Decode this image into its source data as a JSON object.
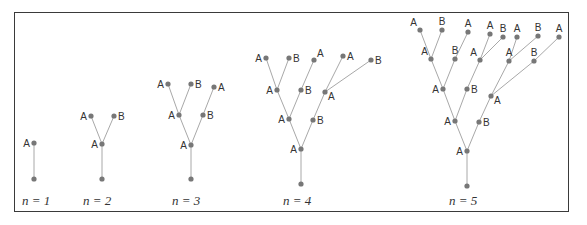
{
  "figure": {
    "edge_color": "#a8a8a8",
    "node_color": "#777777",
    "frame_color": "#3a3a3a",
    "panels": [
      {
        "label": "n = 1",
        "label_pos": [
          22,
          205
        ],
        "nodes": [
          {
            "id": "r",
            "x": 34,
            "y": 179,
            "label": ""
          },
          {
            "id": "a",
            "x": 34,
            "y": 143,
            "label": "A",
            "side": "left"
          }
        ],
        "edges": [
          [
            "r",
            "a"
          ]
        ]
      },
      {
        "label": "n = 2",
        "label_pos": [
          83,
          205
        ],
        "nodes": [
          {
            "id": "r",
            "x": 102,
            "y": 179,
            "label": ""
          },
          {
            "id": "a",
            "x": 102,
            "y": 144,
            "label": "A",
            "side": "left"
          },
          {
            "id": "aa",
            "x": 91,
            "y": 116,
            "label": "A",
            "side": "left"
          },
          {
            "id": "ab",
            "x": 114,
            "y": 116,
            "label": "B",
            "side": "right"
          }
        ],
        "edges": [
          [
            "r",
            "a"
          ],
          [
            "a",
            "aa"
          ],
          [
            "a",
            "ab"
          ]
        ]
      },
      {
        "label": "n = 3",
        "label_pos": [
          172,
          205
        ],
        "nodes": [
          {
            "id": "r",
            "x": 191,
            "y": 179,
            "label": ""
          },
          {
            "id": "a",
            "x": 191,
            "y": 145,
            "label": "A",
            "side": "left"
          },
          {
            "id": "aa",
            "x": 179,
            "y": 115,
            "label": "A",
            "side": "left"
          },
          {
            "id": "ab",
            "x": 203,
            "y": 115,
            "label": "B",
            "side": "right"
          },
          {
            "id": "aaa",
            "x": 168,
            "y": 84,
            "label": "A",
            "side": "left"
          },
          {
            "id": "aab",
            "x": 191,
            "y": 84,
            "label": "B",
            "side": "right"
          },
          {
            "id": "aba",
            "x": 214,
            "y": 87,
            "label": "A",
            "side": "right"
          }
        ],
        "edges": [
          [
            "r",
            "a"
          ],
          [
            "a",
            "aa"
          ],
          [
            "a",
            "ab"
          ],
          [
            "aa",
            "aaa"
          ],
          [
            "aa",
            "aab"
          ],
          [
            "ab",
            "aba"
          ]
        ]
      },
      {
        "label": "n = 4",
        "label_pos": [
          283,
          205
        ],
        "nodes": [
          {
            "id": "r",
            "x": 301,
            "y": 184,
            "label": ""
          },
          {
            "id": "a",
            "x": 301,
            "y": 149,
            "label": "A",
            "side": "left"
          },
          {
            "id": "aa",
            "x": 289,
            "y": 119,
            "label": "A",
            "side": "left"
          },
          {
            "id": "ab",
            "x": 313,
            "y": 120,
            "label": "B",
            "side": "right"
          },
          {
            "id": "aaa",
            "x": 277,
            "y": 90,
            "label": "A",
            "side": "left"
          },
          {
            "id": "aab",
            "x": 301,
            "y": 90,
            "label": "B",
            "side": "right"
          },
          {
            "id": "aba",
            "x": 325,
            "y": 92,
            "label": "A",
            "side": "right-below"
          },
          {
            "id": "aaaa",
            "x": 266,
            "y": 58,
            "label": "A",
            "side": "left"
          },
          {
            "id": "aaab",
            "x": 289,
            "y": 58,
            "label": "B",
            "side": "right"
          },
          {
            "id": "aaba",
            "x": 314,
            "y": 60,
            "label": "A",
            "side": "right-above"
          },
          {
            "id": "abaa",
            "x": 343,
            "y": 56,
            "label": "A",
            "side": "right"
          },
          {
            "id": "abab",
            "x": 371,
            "y": 60,
            "label": "B",
            "side": "right"
          }
        ],
        "edges": [
          [
            "r",
            "a"
          ],
          [
            "a",
            "aa"
          ],
          [
            "a",
            "ab"
          ],
          [
            "aa",
            "aaa"
          ],
          [
            "aa",
            "aab"
          ],
          [
            "ab",
            "aba"
          ],
          [
            "aaa",
            "aaaa"
          ],
          [
            "aaa",
            "aaab"
          ],
          [
            "aab",
            "aaba"
          ],
          [
            "aba",
            "abaa"
          ],
          [
            "aba",
            "abab"
          ]
        ]
      },
      {
        "label": "n = 5",
        "label_pos": [
          449,
          205
        ],
        "nodes": [
          {
            "id": "r",
            "x": 467,
            "y": 186,
            "label": ""
          },
          {
            "id": "a",
            "x": 467,
            "y": 151,
            "label": "A",
            "side": "left"
          },
          {
            "id": "aa",
            "x": 455,
            "y": 121,
            "label": "A",
            "side": "left"
          },
          {
            "id": "ab",
            "x": 479,
            "y": 122,
            "label": "B",
            "side": "right"
          },
          {
            "id": "aaa",
            "x": 443,
            "y": 89,
            "label": "A",
            "side": "left"
          },
          {
            "id": "aab",
            "x": 467,
            "y": 89,
            "label": "B",
            "side": "right"
          },
          {
            "id": "aba",
            "x": 491,
            "y": 96,
            "label": "A",
            "side": "right-below"
          },
          {
            "id": "aaaa",
            "x": 431,
            "y": 59,
            "label": "A",
            "side": "left-above"
          },
          {
            "id": "aaab",
            "x": 455,
            "y": 59,
            "label": "B",
            "side": "above"
          },
          {
            "id": "aaba",
            "x": 480,
            "y": 60,
            "label": "A",
            "side": "left-above"
          },
          {
            "id": "abaa",
            "x": 509,
            "y": 61,
            "label": "A",
            "side": "above"
          },
          {
            "id": "abab",
            "x": 534,
            "y": 61,
            "label": "B",
            "side": "above"
          },
          {
            "id": "aaaaa",
            "x": 420,
            "y": 30,
            "label": "A",
            "side": "left-above"
          },
          {
            "id": "aaaab",
            "x": 442,
            "y": 30,
            "label": "B",
            "side": "above"
          },
          {
            "id": "aaaba",
            "x": 468,
            "y": 32,
            "label": "A",
            "side": "above"
          },
          {
            "id": "aabaa",
            "x": 490,
            "y": 34,
            "label": "A",
            "side": "above"
          },
          {
            "id": "aabab",
            "x": 503,
            "y": 37,
            "label": "B",
            "side": "above"
          },
          {
            "id": "abaaa",
            "x": 517,
            "y": 37,
            "label": "A",
            "side": "above"
          },
          {
            "id": "abaab",
            "x": 538,
            "y": 36,
            "label": "B",
            "side": "above"
          },
          {
            "id": "ababa",
            "x": 559,
            "y": 37,
            "label": "A",
            "side": "above"
          }
        ],
        "edges": [
          [
            "r",
            "a"
          ],
          [
            "a",
            "aa"
          ],
          [
            "a",
            "ab"
          ],
          [
            "aa",
            "aaa"
          ],
          [
            "aa",
            "aab"
          ],
          [
            "ab",
            "aba"
          ],
          [
            "aaa",
            "aaaa"
          ],
          [
            "aaa",
            "aaab"
          ],
          [
            "aab",
            "aaba"
          ],
          [
            "aba",
            "abaa"
          ],
          [
            "aba",
            "abab"
          ],
          [
            "aaaa",
            "aaaaa"
          ],
          [
            "aaaa",
            "aaaab"
          ],
          [
            "aaab",
            "aaaba"
          ],
          [
            "aaba",
            "aabaa"
          ],
          [
            "aaba",
            "aabab"
          ],
          [
            "abaa",
            "abaaa"
          ],
          [
            "abaa",
            "abaab"
          ],
          [
            "abab",
            "ababa"
          ]
        ]
      }
    ]
  }
}
